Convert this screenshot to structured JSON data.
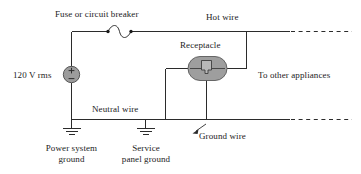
{
  "figure": {
    "kind": "electrical-wiring-diagram"
  },
  "labels": {
    "fuse": "Fuse or circuit breaker",
    "hot_wire": "Hot wire",
    "receptacle": "Receptacle",
    "source_voltage": "120 V rms",
    "to_other_appliances": "To other appliances",
    "neutral_wire": "Neutral wire",
    "ground_wire": "Ground wire",
    "power_system_ground_line1": "Power system",
    "power_system_ground_line2": "ground",
    "service_panel_ground_line1": "Service",
    "service_panel_ground_line2": "panel ground"
  },
  "symbols": {
    "source": "ac-voltage-source-icon",
    "source_plus": "+",
    "source_minus": "−",
    "fuse": "fuse-icon",
    "receptacle": "receptacle-icon",
    "ground_power_system": "ground-icon",
    "ground_service_panel": "ground-icon",
    "leader_arrow": "arrow-icon"
  },
  "colors": {
    "wire": "#2b2b2b",
    "source_fill": "#9c9c9c",
    "receptacle_fill": "#9e9e9e",
    "background": "#ffffff",
    "text": "#1b1b1b"
  }
}
